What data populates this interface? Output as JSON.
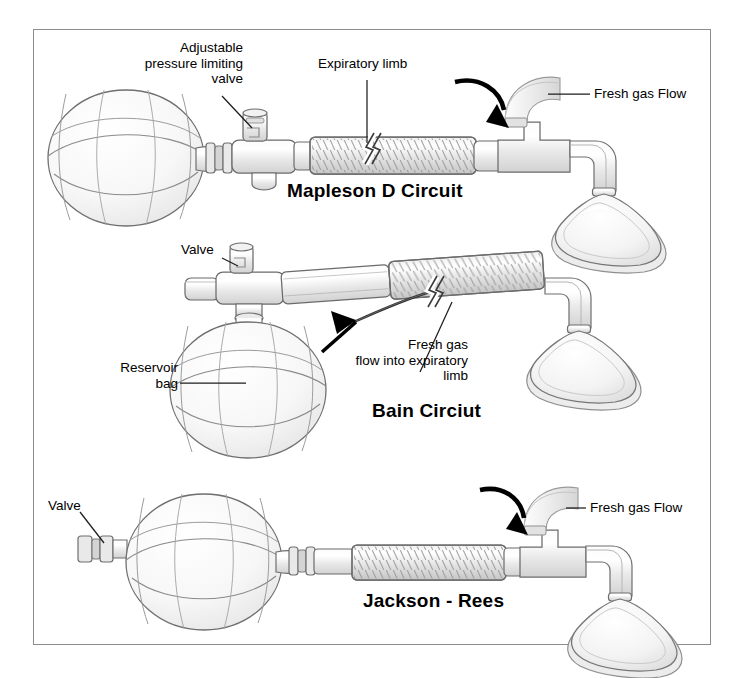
{
  "figure": {
    "kind": "anesthesia-breathing-circuits-diagram",
    "border_color": "#8d8d8d",
    "background_color": "#ffffff",
    "line_color": "#6b6b6b",
    "fill_light": "#f4f4f4",
    "fill_mid": "#e3e3e3",
    "fill_dark": "#cfcfcf",
    "arrow_color": "#000000"
  },
  "circuits": [
    {
      "id": "mapleson-d",
      "title": "Mapleson D Circuit",
      "labels": [
        {
          "name": "adjustable-pressure-limiting-valve",
          "text": "Adjustable\npressure limiting\nvalve",
          "align": "right"
        },
        {
          "name": "expiratory-limb",
          "text": "Expiratory limb",
          "align": "left"
        },
        {
          "name": "fresh-gas-flow",
          "text": "Fresh gas Flow",
          "align": "left"
        }
      ]
    },
    {
      "id": "bain",
      "title": "Bain Circiut",
      "labels": [
        {
          "name": "valve",
          "text": "Valve",
          "align": "left"
        },
        {
          "name": "reservoir-bag",
          "text": "Reservoir\nbag",
          "align": "right"
        },
        {
          "name": "fresh-gas-flow-into-expiratory-limb",
          "text": "Fresh gas\nflow into expiratory\nlimb",
          "align": "right"
        }
      ]
    },
    {
      "id": "jackson-rees",
      "title": "Jackson - Rees",
      "labels": [
        {
          "name": "valve",
          "text": "Valve",
          "align": "left"
        },
        {
          "name": "fresh-gas-flow",
          "text": "Fresh gas Flow",
          "align": "left"
        }
      ]
    }
  ],
  "text": {
    "apl_valve": "Adjustable\npressure limiting\nvalve",
    "expiratory_limb": "Expiratory limb",
    "fresh_gas_flow_1": "Fresh gas Flow",
    "mapleson_title": "Mapleson D Circuit",
    "valve_2": "Valve",
    "reservoir_bag": "Reservoir\nbag",
    "fgf_into_limb": "Fresh gas\nflow into expiratory\nlimb",
    "bain_title": "Bain Circiut",
    "valve_3": "Valve",
    "fresh_gas_flow_3": "Fresh gas Flow",
    "jackson_title": "Jackson - Rees"
  }
}
